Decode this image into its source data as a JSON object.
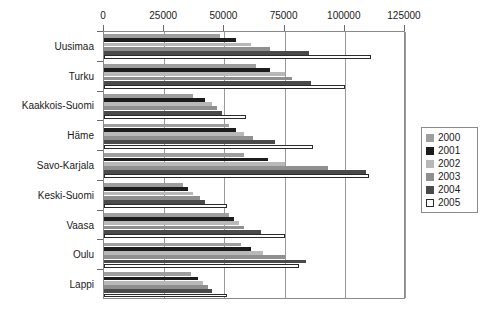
{
  "chart_data": {
    "type": "bar",
    "orientation": "horizontal",
    "title": "",
    "xlabel": "",
    "ylabel": "",
    "xlim": [
      0,
      125000
    ],
    "grid": true,
    "legend_position": "right",
    "xticks": [
      0,
      25000,
      50000,
      75000,
      100000,
      125000
    ],
    "xtick_labels": [
      "0",
      "25000",
      "50000",
      "75000",
      "100000",
      "125000"
    ],
    "categories": [
      "Uusimaa",
      "Turku",
      "Kaakkois-Suomi",
      "Häme",
      "Savo-Karjala",
      "Keski-Suomi",
      "Vaasa",
      "Oulu",
      "Lappi"
    ],
    "series": [
      {
        "name": "2000",
        "color": "#9e9e9e",
        "values": [
          48000,
          63000,
          37000,
          52000,
          58000,
          33000,
          52000,
          57000,
          36000
        ]
      },
      {
        "name": "2001",
        "color": "#1c1c1c",
        "values": [
          55000,
          69000,
          42000,
          55000,
          68000,
          35000,
          54000,
          61000,
          39000
        ]
      },
      {
        "name": "2002",
        "color": "#b8b8b8",
        "values": [
          61000,
          75000,
          45000,
          58000,
          75000,
          37000,
          56000,
          66000,
          41000
        ]
      },
      {
        "name": "2003",
        "color": "#8f8f8f",
        "values": [
          69000,
          78000,
          47000,
          62000,
          93000,
          40000,
          58000,
          75000,
          43000
        ]
      },
      {
        "name": "2004",
        "color": "#4a4a4a",
        "values": [
          85000,
          86000,
          49000,
          71000,
          109000,
          42000,
          65000,
          84000,
          45000
        ]
      },
      {
        "name": "2005",
        "color": "#ffffff",
        "values": [
          111000,
          100000,
          59000,
          87000,
          110000,
          51000,
          75000,
          81000,
          51000
        ]
      }
    ]
  },
  "legend": {
    "items": [
      {
        "label": "2000"
      },
      {
        "label": "2001"
      },
      {
        "label": "2002"
      },
      {
        "label": "2003"
      },
      {
        "label": "2004"
      },
      {
        "label": "2005"
      }
    ]
  },
  "colors": {
    "axis": "#8a8a8a",
    "grid": "#9a9a9a",
    "text": "#1a1a1a",
    "plot_background": "#ffffff"
  }
}
